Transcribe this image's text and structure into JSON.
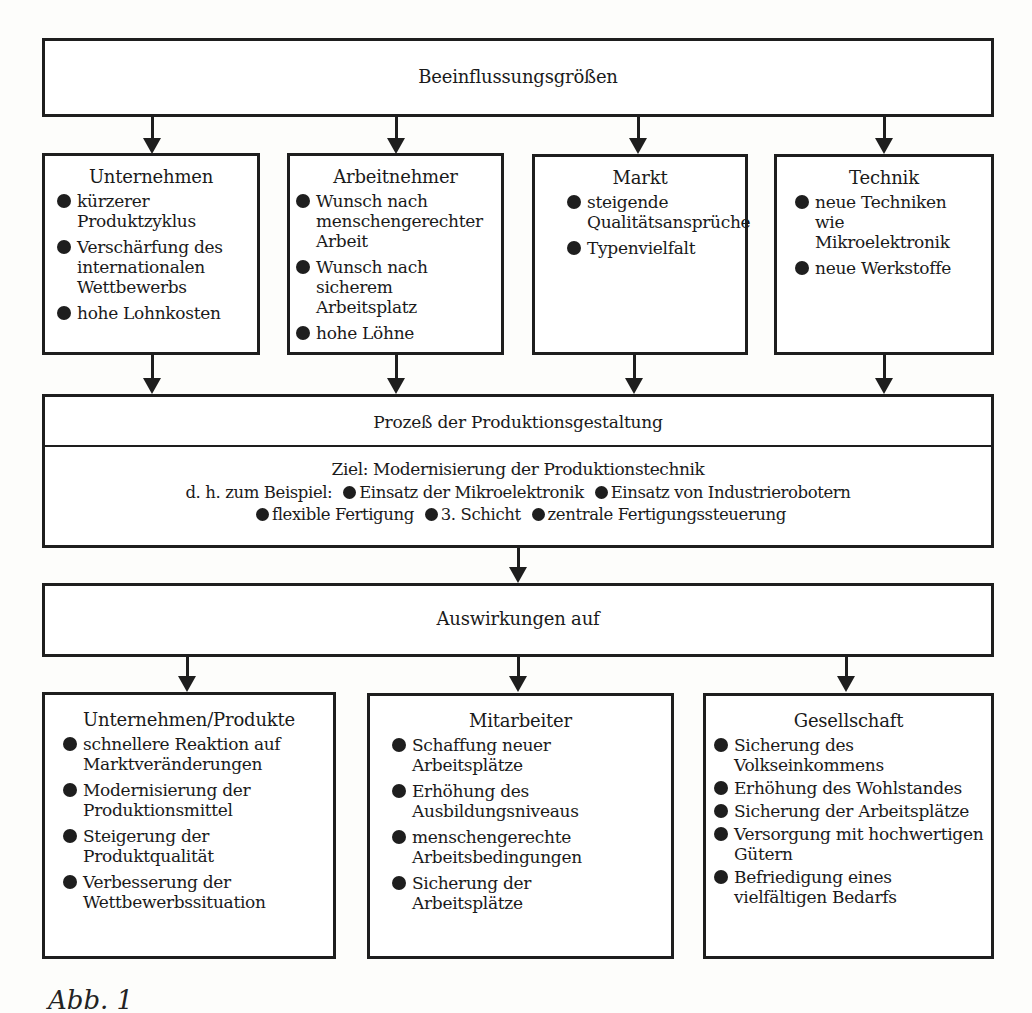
{
  "top": {
    "title": "Beeinflussungsgrößen"
  },
  "influences": [
    {
      "title": "Unternehmen",
      "items": [
        "kürzerer Produktzyklus",
        "Verschärfung des internationalen Wettbewerbs",
        "hohe Lohnkosten"
      ]
    },
    {
      "title": "Arbeitnehmer",
      "items": [
        "Wunsch nach menschengerechter Arbeit",
        "Wunsch nach sicherem Arbeitsplatz",
        "hohe Löhne"
      ]
    },
    {
      "title": "Markt",
      "items": [
        "steigende Qualitätsansprüche",
        "Typenvielfalt"
      ]
    },
    {
      "title": "Technik",
      "items": [
        "neue Techniken wie Mikroelektronik",
        "neue Werkstoffe"
      ]
    }
  ],
  "process": {
    "title": "Prozeß der Produktionsgestaltung",
    "goal": "Ziel: Modernisierung der Produktionstechnik",
    "examples_label": "d. h. zum Beispiel:",
    "examples": [
      "Einsatz der Mikroelektronik",
      "Einsatz von Industrierobotern",
      "flexible Fertigung",
      "3. Schicht",
      "zentrale Fertigungssteuerung"
    ]
  },
  "effects": {
    "title": "Auswirkungen auf"
  },
  "impacts": [
    {
      "title": "Unternehmen/Produkte",
      "items": [
        "schnellere Reaktion auf Marktveränderungen",
        "Modernisierung der Produktionsmittel",
        "Steigerung der Produktqualität",
        "Verbesserung der Wettbewerbssituation"
      ]
    },
    {
      "title": "Mitarbeiter",
      "items": [
        "Schaffung neuer Arbeitsplätze",
        "Erhöhung des Ausbildungsniveaus",
        "menschengerechte Arbeitsbedingungen",
        "Sicherung der Arbeitsplätze"
      ]
    },
    {
      "title": "Gesellschaft",
      "items": [
        "Sicherung des Volkseinkommens",
        "Erhöhung des Wohlstandes",
        "Sicherung der Arbeitsplätze",
        "Versorgung mit hochwertigen Gütern",
        "Befriedigung eines vielfältigen Bedarfs"
      ]
    }
  ],
  "caption": "Abb. 1"
}
